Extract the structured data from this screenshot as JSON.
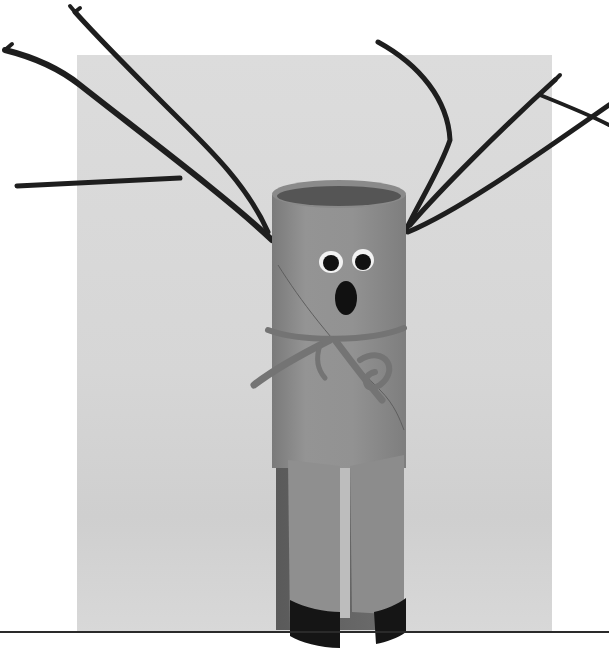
{
  "image": {
    "subject": "Toilet paper tube reindeer craft with twig antlers",
    "style": "black-and-white photograph",
    "elements": {
      "background_panel": {
        "color": "#d8d8d8"
      },
      "baseline_rule": {
        "color": "#2a2a2a"
      },
      "tube_body": {
        "color": "#8e8e8e",
        "shade": "#6f6f6f"
      },
      "antlers": {
        "color": "#1e1e1e",
        "count": 2
      },
      "eyes": {
        "count": 2,
        "white": "#f2f2f2",
        "pupil": "#111111"
      },
      "mouth": {
        "shape": "oval",
        "color": "#111111"
      },
      "scarf": {
        "material": "yarn",
        "color": "#7a7a7a"
      },
      "legs": {
        "count": 2,
        "hoof_color": "#151515"
      }
    }
  }
}
